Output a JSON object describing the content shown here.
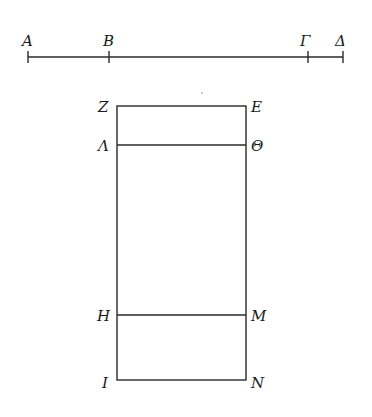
{
  "figure": {
    "type": "geometric-diagram",
    "colors": {
      "stroke": "#2a2a2a",
      "label": "#1a1a1a",
      "background": "#ffffff"
    }
  },
  "segment": {
    "y": 57,
    "points": [
      {
        "label": "A",
        "x": 28
      },
      {
        "label": "B",
        "x": 109
      },
      {
        "label": "Γ",
        "x": 308
      },
      {
        "label": "Δ",
        "x": 343
      }
    ]
  },
  "rectangle": {
    "left_x": 117,
    "right_x": 246,
    "rows": [
      {
        "left_label": "Z",
        "right_label": "E",
        "y": 106
      },
      {
        "left_label": "Λ",
        "right_label": "Θ",
        "y": 145
      },
      {
        "left_label": "H",
        "right_label": "M",
        "y": 315
      },
      {
        "left_label": "I",
        "right_label": "N",
        "y": 380
      }
    ]
  }
}
